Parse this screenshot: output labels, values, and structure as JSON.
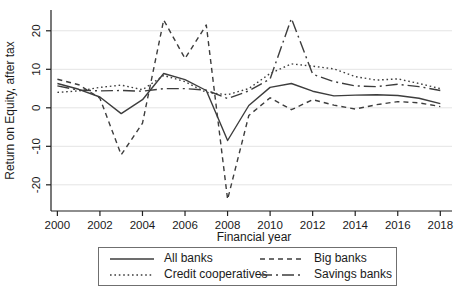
{
  "chart_data": {
    "type": "line",
    "title": "",
    "ylabel": "Return on Equity, after tax",
    "xlabel": "Financial year",
    "x": [
      2000,
      2001,
      2002,
      2003,
      2004,
      2005,
      2006,
      2007,
      2008,
      2009,
      2010,
      2011,
      2012,
      2013,
      2014,
      2015,
      2016,
      2017,
      2018
    ],
    "xticks": [
      2000,
      2002,
      2004,
      2006,
      2008,
      2010,
      2012,
      2014,
      2016,
      2018
    ],
    "yticks": [
      -20,
      -10,
      0,
      10,
      20
    ],
    "xlim": [
      1999.7,
      2018.55
    ],
    "ylim": [
      -26.8,
      25.4
    ],
    "grid": "horizontal",
    "legend_position": "bottom",
    "series": [
      {
        "name": "All banks",
        "style": "solid",
        "values": [
          6.3,
          4.8,
          2.8,
          -1.5,
          2.1,
          8.9,
          7.3,
          4.5,
          -8.5,
          0.6,
          5.3,
          6.3,
          4.3,
          3.1,
          3.3,
          3.4,
          3.2,
          2.5,
          1.1
        ]
      },
      {
        "name": "Big banks",
        "style": "dash",
        "values": [
          7.4,
          6.0,
          2.5,
          -12.2,
          -4.0,
          22.8,
          12.8,
          21.5,
          -23.8,
          -2.0,
          2.6,
          -0.5,
          2.1,
          0.7,
          -0.3,
          0.8,
          1.6,
          1.3,
          0.3
        ]
      },
      {
        "name": "Credit cooperatives",
        "style": "dot",
        "values": [
          4.0,
          4.4,
          5.3,
          5.9,
          4.7,
          8.4,
          6.8,
          4.0,
          3.4,
          5.0,
          8.9,
          11.4,
          10.8,
          10.1,
          8.1,
          7.2,
          7.5,
          6.3,
          5.0
        ]
      },
      {
        "name": "Savings banks",
        "style": "dashdot",
        "values": [
          5.7,
          4.6,
          4.4,
          4.5,
          4.3,
          5.0,
          5.0,
          4.6,
          2.4,
          4.4,
          7.5,
          23.2,
          8.7,
          6.8,
          5.7,
          5.5,
          6.1,
          5.5,
          4.5
        ]
      }
    ]
  },
  "colors": {
    "line": "#3d3d3d",
    "grid": "#e4e4e4",
    "axis": "#1f1f1f",
    "text": "#1a1a1a",
    "legend_border": "#6f6f6f",
    "background": "#ffffff"
  }
}
